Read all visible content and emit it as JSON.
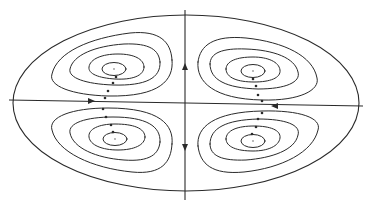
{
  "diagram": {
    "title": "",
    "colors": {
      "background": "#ffffff",
      "line": "#2a2a2a",
      "center_dot": "#9a9a9a"
    },
    "boundary": {
      "shape": "ellipse"
    },
    "axes": [
      {
        "id": "horizontal",
        "arrows": [
          {
            "direction": "right",
            "side": "left"
          },
          {
            "direction": "left",
            "side": "right"
          }
        ]
      },
      {
        "id": "vertical",
        "arrows": [
          {
            "direction": "up",
            "side": "upper"
          },
          {
            "direction": "down",
            "side": "lower"
          }
        ]
      }
    ],
    "cells": [
      {
        "quadrant": "upper-left",
        "streamline_count": 4,
        "has_center_point": true
      },
      {
        "quadrant": "upper-right",
        "streamline_count": 4,
        "has_center_point": true
      },
      {
        "quadrant": "lower-left",
        "streamline_count": 4,
        "has_center_point": true
      },
      {
        "quadrant": "lower-right",
        "streamline_count": 4,
        "has_center_point": true
      }
    ]
  }
}
